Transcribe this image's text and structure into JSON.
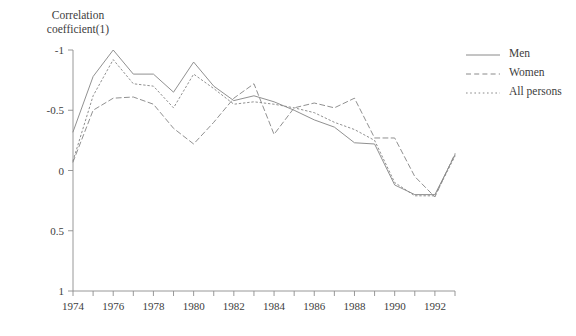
{
  "title": "",
  "axis": {
    "y_title_line1": "Correlation",
    "y_title_line2": "coefficient(1)",
    "y_ticks": [
      "1",
      "0.5",
      "0",
      "-0.5",
      "-1"
    ],
    "x_ticks": [
      "1974",
      "1976",
      "1978",
      "1980",
      "1982",
      "1984",
      "1986",
      "1988",
      "1990",
      "1992"
    ]
  },
  "legend": {
    "position": "right",
    "items": [
      {
        "label": "Men",
        "style": "solid",
        "icon": "line-solid-icon"
      },
      {
        "label": "Women",
        "style": "dashed",
        "icon": "line-dashed-icon"
      },
      {
        "label": "All persons",
        "style": "dotted",
        "icon": "line-dotted-icon"
      }
    ]
  },
  "colors": {
    "axis": "#8d8d8d",
    "series": "#8a8a8a",
    "text": "#3d3d3d",
    "background": "#ffffff"
  },
  "chart_data": {
    "type": "line",
    "title": "",
    "xlabel": "",
    "ylabel": "Correlation coefficient(1)",
    "xlim": [
      1974,
      1993
    ],
    "ylim": [
      -1,
      1
    ],
    "yticks": [
      -1,
      -0.5,
      0,
      0.5,
      1
    ],
    "xticks": [
      1974,
      1976,
      1978,
      1980,
      1982,
      1984,
      1986,
      1988,
      1990,
      1992
    ],
    "grid": false,
    "legend_position": "right",
    "x": [
      1974,
      1975,
      1976,
      1977,
      1978,
      1979,
      1980,
      1981,
      1982,
      1983,
      1984,
      1985,
      1986,
      1987,
      1988,
      1989,
      1990,
      1991,
      1992,
      1993
    ],
    "series": [
      {
        "name": "Men",
        "style": "solid",
        "values": [
          0.32,
          0.78,
          1.0,
          0.8,
          0.8,
          0.65,
          0.9,
          0.7,
          0.58,
          0.62,
          0.57,
          0.5,
          0.42,
          0.36,
          0.23,
          0.22,
          -0.12,
          -0.2,
          -0.2,
          0.13
        ]
      },
      {
        "name": "Women",
        "style": "dashed",
        "values": [
          0.07,
          0.5,
          0.6,
          0.61,
          0.55,
          0.35,
          0.22,
          0.4,
          0.6,
          0.72,
          0.3,
          0.52,
          0.56,
          0.52,
          0.6,
          0.27,
          0.27,
          -0.05,
          -0.22,
          0.14
        ]
      },
      {
        "name": "All persons",
        "style": "dotted",
        "values": [
          0.08,
          0.62,
          0.92,
          0.72,
          0.7,
          0.52,
          0.8,
          0.68,
          0.55,
          0.57,
          0.55,
          0.52,
          0.48,
          0.4,
          0.34,
          0.25,
          -0.1,
          -0.21,
          -0.21,
          0.12
        ]
      }
    ]
  }
}
